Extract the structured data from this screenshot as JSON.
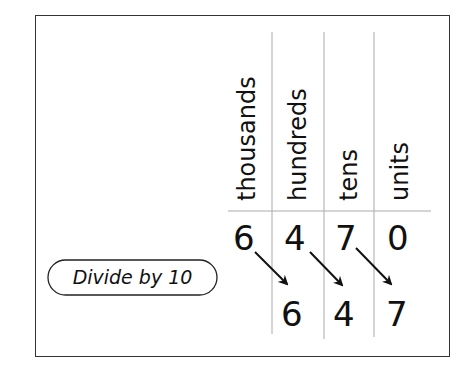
{
  "diagram": {
    "columns": [
      {
        "label": "thousands"
      },
      {
        "label": "hundreds"
      },
      {
        "label": "tens"
      },
      {
        "label": "units"
      }
    ],
    "original_row": [
      "6",
      "4",
      "7",
      "0"
    ],
    "result_row": [
      "",
      "6",
      "4",
      "7"
    ],
    "operation_label": "Divide by 10",
    "arrows": [
      {
        "from": "thousands",
        "to": "hundreds"
      },
      {
        "from": "hundreds",
        "to": "tens"
      },
      {
        "from": "tens",
        "to": "units"
      }
    ],
    "colors": {
      "ink": "#111111",
      "grid": "#aaaaaa",
      "frame": "#333333"
    }
  }
}
